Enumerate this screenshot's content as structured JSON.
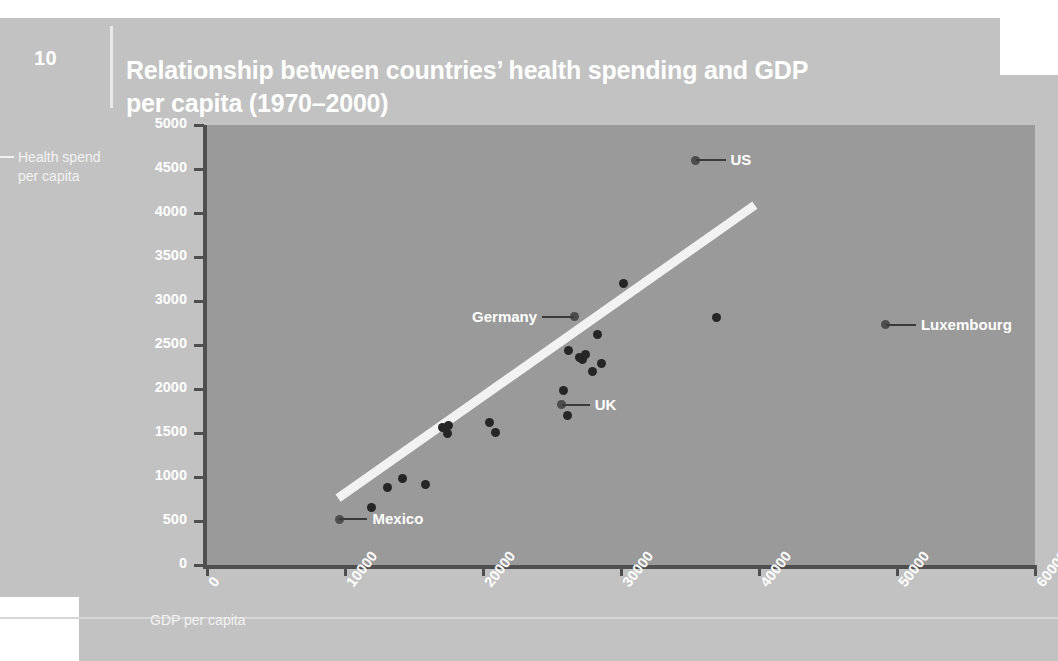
{
  "page": {
    "figure_number": "10",
    "background_color": "#c2c2c2",
    "plot_background_color": "#9a9a9a",
    "title_color": "#ffffff",
    "point_color": "#262626",
    "trendline_color": "#f2f2f2"
  },
  "header": {
    "title": "Relationship between countries’ health spending and GDP per capita (1970–2000)"
  },
  "axes": {
    "y_caption_line1": "Health spend",
    "y_caption_line2": "per capita",
    "x_caption": "GDP per capita"
  },
  "chart_data": {
    "type": "scatter",
    "title": "Relationship between countries’ health spending and GDP per capita (1970–2000)",
    "xlabel": "GDP per capita",
    "ylabel": "Health spend per capita",
    "xlim": [
      0,
      60000
    ],
    "ylim": [
      0,
      5000
    ],
    "xticks": [
      0,
      10000,
      20000,
      30000,
      40000,
      50000,
      60000
    ],
    "xtick_labels": [
      "0",
      "10000",
      "20000",
      "30000",
      "40000",
      "50000",
      "60000"
    ],
    "yticks": [
      0,
      500,
      1000,
      1500,
      2000,
      2500,
      3000,
      3500,
      4000,
      4500,
      5000
    ],
    "ytick_labels": [
      "0",
      "500",
      "1000",
      "1500",
      "2000",
      "2500",
      "3000",
      "3500",
      "4000",
      "4500",
      "5000"
    ],
    "grid": false,
    "legend": false,
    "points": [
      {
        "x": 9600,
        "y": 520,
        "label": "Mexico"
      },
      {
        "x": 11900,
        "y": 650,
        "label": ""
      },
      {
        "x": 13100,
        "y": 880,
        "label": ""
      },
      {
        "x": 14200,
        "y": 980,
        "label": ""
      },
      {
        "x": 15800,
        "y": 920,
        "label": ""
      },
      {
        "x": 17100,
        "y": 1560,
        "label": ""
      },
      {
        "x": 17400,
        "y": 1500,
        "label": ""
      },
      {
        "x": 17500,
        "y": 1590,
        "label": ""
      },
      {
        "x": 20500,
        "y": 1620,
        "label": ""
      },
      {
        "x": 20900,
        "y": 1510,
        "label": ""
      },
      {
        "x": 25700,
        "y": 1820,
        "label": "UK"
      },
      {
        "x": 26100,
        "y": 1700,
        "label": ""
      },
      {
        "x": 25800,
        "y": 1980,
        "label": ""
      },
      {
        "x": 26200,
        "y": 2440,
        "label": ""
      },
      {
        "x": 26600,
        "y": 2820,
        "label": "Germany"
      },
      {
        "x": 27000,
        "y": 2360,
        "label": ""
      },
      {
        "x": 27200,
        "y": 2330,
        "label": ""
      },
      {
        "x": 27400,
        "y": 2390,
        "label": ""
      },
      {
        "x": 27900,
        "y": 2200,
        "label": ""
      },
      {
        "x": 28300,
        "y": 2620,
        "label": ""
      },
      {
        "x": 28600,
        "y": 2290,
        "label": ""
      },
      {
        "x": 30200,
        "y": 3200,
        "label": ""
      },
      {
        "x": 35400,
        "y": 4600,
        "label": "US"
      },
      {
        "x": 36900,
        "y": 2810,
        "label": ""
      },
      {
        "x": 49200,
        "y": 2730,
        "label": "Luxembourg"
      }
    ],
    "annotations": [
      {
        "label": "US",
        "x": 35400,
        "y": 4600
      },
      {
        "label": "Germany",
        "x": 26600,
        "y": 2820
      },
      {
        "label": "UK",
        "x": 25700,
        "y": 1820
      },
      {
        "label": "Mexico",
        "x": 9600,
        "y": 520
      },
      {
        "label": "Luxembourg",
        "x": 49200,
        "y": 2730
      }
    ],
    "trendline": {
      "x0": 9500,
      "y0": 760,
      "x1": 39700,
      "y1": 4090
    }
  }
}
